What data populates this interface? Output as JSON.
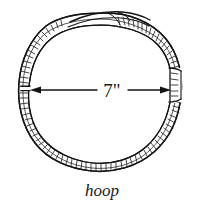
{
  "figure": {
    "kind": "line-art-illustration",
    "subject": "hoop",
    "background_color": "#ffffff",
    "ink_color": "#141414",
    "caption": "hoop",
    "dimension": {
      "label": "7\"",
      "value": 7,
      "unit": "inch",
      "measures": "inside diameter",
      "arrow_style": "double-headed",
      "orientation": "horizontal"
    },
    "drawing_notes": {
      "outline_style": "hand-drawn ink contour",
      "texture": "short perpendicular hatch ticks along outer band edge",
      "band": "bent wood strip formed into a ring with overlapping ends at top",
      "breaks": "small gaps in band at left and right where arrow tips meet"
    }
  }
}
